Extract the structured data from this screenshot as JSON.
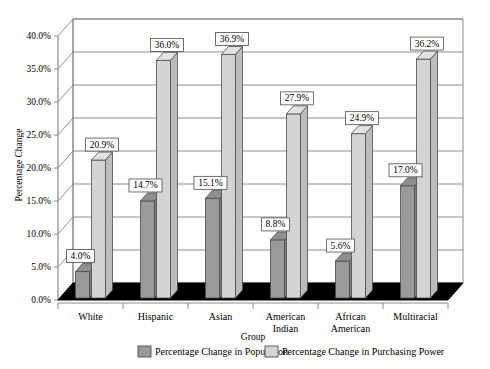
{
  "chart_data": {
    "type": "bar",
    "title": "",
    "subtitle": "",
    "xlabel": "Group",
    "ylabel": "Percentage Change",
    "categories": [
      "White",
      "Hispanic",
      "Asian",
      "American Indian",
      "African American",
      "Multiracial"
    ],
    "category_lines": [
      [
        "White"
      ],
      [
        "Hispanic"
      ],
      [
        "Asian"
      ],
      [
        "American",
        "Indian"
      ],
      [
        "African",
        "American"
      ],
      [
        "Multiracial"
      ]
    ],
    "series": [
      {
        "name": "Percentage Change in Population",
        "color": "#9a9a9a",
        "values": [
          4.0,
          14.7,
          15.1,
          8.8,
          5.6,
          17.0
        ],
        "labels": [
          "4.0%",
          "14.7%",
          "15.1%",
          "8.8%",
          "5.6%",
          "17.0%"
        ]
      },
      {
        "name": "Percentage Change in Purchasing Power",
        "color": "#d4d4d4",
        "values": [
          20.9,
          36.0,
          36.9,
          27.9,
          24.9,
          36.2
        ],
        "labels": [
          "20.9%",
          "36.0%",
          "36.9%",
          "27.9%",
          "24.9%",
          "36.2%"
        ]
      }
    ],
    "ylim": [
      0,
      40
    ],
    "ytick_values": [
      0.0,
      5.0,
      10.0,
      15.0,
      20.0,
      25.0,
      30.0,
      35.0,
      40.0
    ],
    "ytick_labels": [
      "0.0%",
      "5.0%",
      "10.0%",
      "15.0%",
      "20.0%",
      "25.0%",
      "30.0%",
      "35.0%",
      "40.0%"
    ],
    "grid": true,
    "legend_position": "bottom",
    "style": "3d-column",
    "floor_color": "#000000",
    "wall_color": "#ffffff",
    "gridline_color": "#808080"
  },
  "legend": {
    "items": [
      {
        "label": "Percentage Change in Population",
        "swatch": "#9a9a9a"
      },
      {
        "label": "Percentage Change in Purchasing Power",
        "swatch": "#d4d4d4"
      }
    ]
  },
  "axes": {
    "y_title": "Percentage Change",
    "x_title": "Group"
  }
}
